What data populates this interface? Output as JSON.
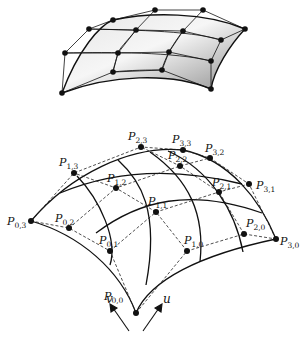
{
  "figure": {
    "top": {
      "description": "Shaded bicubic surface with its 4x4 control net",
      "surface_fill": [
        "#f4f4f4",
        "#9a9a9a"
      ],
      "net_points": [
        [
          62,
          93
        ],
        [
          65,
          53
        ],
        [
          89,
          29
        ],
        [
          113,
          20
        ],
        [
          113,
          72
        ],
        [
          118,
          53
        ],
        [
          136,
          30
        ],
        [
          155,
          10
        ],
        [
          162,
          70
        ],
        [
          169,
          52
        ],
        [
          183,
          31
        ],
        [
          203,
          10
        ],
        [
          211,
          89
        ],
        [
          211,
          61
        ],
        [
          221,
          40
        ],
        [
          245,
          29
        ]
      ]
    },
    "bottom": {
      "description": "Bezier patch with labelled control points P(i,j) and parameter directions",
      "control_points": [
        {
          "name": "P",
          "i": "0",
          "j": "0",
          "x": 136,
          "y": 313,
          "lx": 104,
          "ly": 300
        },
        {
          "name": "P",
          "i": "0",
          "j": "1",
          "x": 110,
          "y": 251,
          "lx": 99,
          "ly": 244
        },
        {
          "name": "P",
          "i": "0",
          "j": "2",
          "x": 69,
          "y": 228,
          "lx": 55,
          "ly": 222
        },
        {
          "name": "P",
          "i": "0",
          "j": "3",
          "x": 31,
          "y": 221,
          "lx": 7,
          "ly": 225
        },
        {
          "name": "P",
          "i": "1",
          "j": "0",
          "x": 187,
          "y": 251,
          "lx": 184,
          "ly": 244
        },
        {
          "name": "P",
          "i": "1",
          "j": "1",
          "x": 156,
          "y": 212,
          "lx": 148,
          "ly": 205
        },
        {
          "name": "P",
          "i": "1",
          "j": "2",
          "x": 116,
          "y": 188,
          "lx": 107,
          "ly": 182
        },
        {
          "name": "P",
          "i": "1",
          "j": "3",
          "x": 74,
          "y": 173,
          "lx": 59,
          "ly": 166
        },
        {
          "name": "P",
          "i": "2",
          "j": "0",
          "x": 244,
          "y": 234,
          "lx": 246,
          "ly": 227
        },
        {
          "name": "P",
          "i": "2",
          "j": "1",
          "x": 219,
          "y": 192,
          "lx": 212,
          "ly": 186
        },
        {
          "name": "P",
          "i": "2",
          "j": "2",
          "x": 180,
          "y": 166,
          "lx": 168,
          "ly": 159
        },
        {
          "name": "P",
          "i": "2",
          "j": "3",
          "x": 141,
          "y": 147,
          "lx": 128,
          "ly": 140
        },
        {
          "name": "P",
          "i": "3",
          "j": "0",
          "x": 276,
          "y": 239,
          "lx": 280,
          "ly": 245
        },
        {
          "name": "P",
          "i": "3",
          "j": "1",
          "x": 249,
          "y": 184,
          "lx": 256,
          "ly": 189
        },
        {
          "name": "P",
          "i": "3",
          "j": "2",
          "x": 210,
          "y": 158,
          "lx": 205,
          "ly": 152
        },
        {
          "name": "P",
          "i": "3",
          "j": "3",
          "x": 183,
          "y": 150,
          "lx": 172,
          "ly": 143
        }
      ],
      "axes": {
        "u_label": "u",
        "v_label": "v"
      }
    }
  }
}
